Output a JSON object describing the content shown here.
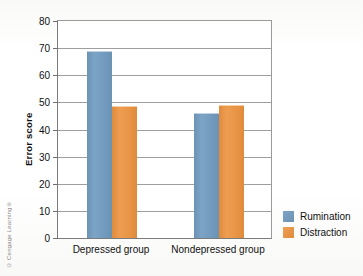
{
  "credit": "© Cengage Learning®",
  "chart_data": {
    "type": "bar",
    "title": "",
    "xlabel": "",
    "ylabel": "Error score",
    "ylim": [
      0,
      80
    ],
    "yticks": [
      0,
      10,
      20,
      30,
      40,
      50,
      60,
      70,
      80
    ],
    "ytick_labels": [
      "0",
      "10",
      "20",
      "30",
      "40",
      "50",
      "60",
      "70",
      "80"
    ],
    "grid": true,
    "legend_position": "right-bottom",
    "categories": [
      "Depressed group",
      "Nondepressed group"
    ],
    "series": [
      {
        "name": "Rumination",
        "color": "#7099bd",
        "values": [
          69,
          46
        ]
      },
      {
        "name": "Distraction",
        "color": "#e8934a",
        "values": [
          48.5,
          49
        ]
      }
    ]
  }
}
